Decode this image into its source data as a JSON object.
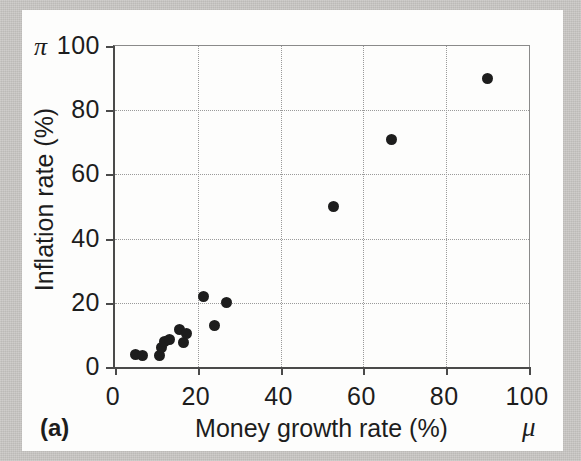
{
  "figure": {
    "panel_label": "(a)",
    "x_symbol": "μ",
    "y_symbol": "π"
  },
  "chart_data": {
    "type": "scatter",
    "title": "",
    "xlabel": "Money growth rate (%)",
    "ylabel": "Inflation rate (%)",
    "xlim": [
      0,
      100
    ],
    "ylim": [
      0,
      100
    ],
    "xticks": [
      0,
      20,
      40,
      60,
      80,
      100
    ],
    "yticks": [
      0,
      20,
      40,
      60,
      80,
      100
    ],
    "xtick_labels": [
      "0",
      "20",
      "40",
      "60",
      "80",
      "100"
    ],
    "ytick_labels": [
      "0",
      "20",
      "40",
      "60",
      "80",
      "100"
    ],
    "grid": true,
    "grid_style": "dotted",
    "legend": null,
    "marker": "filled-circle",
    "marker_color": "#1d1d1d",
    "points": [
      {
        "x": 5,
        "y": 4
      },
      {
        "x": 6.7,
        "y": 3.5
      },
      {
        "x": 10.8,
        "y": 3.5
      },
      {
        "x": 11.3,
        "y": 6
      },
      {
        "x": 12,
        "y": 8
      },
      {
        "x": 13.2,
        "y": 8.5
      },
      {
        "x": 15.6,
        "y": 11.7
      },
      {
        "x": 16.6,
        "y": 7.5
      },
      {
        "x": 17.3,
        "y": 10.5
      },
      {
        "x": 21.4,
        "y": 22
      },
      {
        "x": 24,
        "y": 13
      },
      {
        "x": 27,
        "y": 20
      },
      {
        "x": 52.7,
        "y": 50
      },
      {
        "x": 66.7,
        "y": 71
      },
      {
        "x": 90,
        "y": 90
      }
    ]
  }
}
